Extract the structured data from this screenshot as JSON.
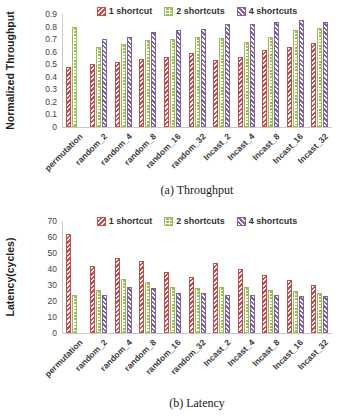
{
  "figure_title": "shortcut comparison figure",
  "chart_data": [
    {
      "type": "bar",
      "caption": "(a) Throughput",
      "ylabel": "Normalized Throughput",
      "ylim": [
        0,
        0.9
      ],
      "yticks": [
        "0",
        "0.1",
        "0.2",
        "0.3",
        "0.4",
        "0.5",
        "0.6",
        "0.7",
        "0.8",
        "0.9"
      ],
      "grid": false,
      "legend_position": "top",
      "categories": [
        "permutation",
        "random_2",
        "random_4",
        "random_8",
        "random_16",
        "random_32",
        "Incast_2",
        "Incast_4",
        "Incast_8",
        "Incast_16",
        "Incast_32"
      ],
      "series": [
        {
          "name": "1 shortcut",
          "color": "#C0504D",
          "pattern": "diagonal-up-hatch",
          "values": [
            0.48,
            0.5,
            0.52,
            0.54,
            0.56,
            0.59,
            0.53,
            0.56,
            0.61,
            0.64,
            0.67
          ]
        },
        {
          "name": "2 shortcuts",
          "color": "#9BBB59",
          "pattern": "horizontal-dash",
          "values": [
            0.8,
            0.64,
            0.66,
            0.69,
            0.7,
            0.72,
            0.71,
            0.68,
            0.72,
            0.77,
            0.79
          ]
        },
        {
          "name": "4 shortcuts",
          "color": "#8064A2",
          "pattern": "diagonal-down-hatch",
          "values": [
            null,
            0.7,
            0.72,
            0.76,
            0.77,
            0.78,
            0.82,
            0.82,
            0.84,
            0.85,
            0.84
          ]
        }
      ]
    },
    {
      "type": "bar",
      "caption": "(b) Latency",
      "ylabel": "Latency(cycles)",
      "ylim": [
        0,
        70
      ],
      "yticks": [
        "0",
        "10",
        "20",
        "30",
        "40",
        "50",
        "60",
        "70"
      ],
      "grid": false,
      "legend_position": "top",
      "categories": [
        "permutation",
        "random_2",
        "random_4",
        "random_8",
        "random_16",
        "random_32",
        "Incast_2",
        "Incast_4",
        "Incast_8",
        "Incast_16",
        "Incast_32"
      ],
      "series": [
        {
          "name": "1 shortcut",
          "color": "#C0504D",
          "pattern": "diagonal-up-hatch",
          "values": [
            62,
            42,
            47,
            45,
            38,
            35,
            44,
            40,
            36,
            33,
            30
          ]
        },
        {
          "name": "2 shortcuts",
          "color": "#9BBB59",
          "pattern": "horizontal-dash",
          "values": [
            24,
            27,
            34,
            32,
            29,
            28,
            29,
            29,
            27,
            26,
            25
          ]
        },
        {
          "name": "4 shortcuts",
          "color": "#8064A2",
          "pattern": "diagonal-down-hatch",
          "values": [
            null,
            24,
            29,
            28,
            25,
            25,
            24,
            24,
            24,
            23,
            23
          ]
        }
      ]
    }
  ]
}
